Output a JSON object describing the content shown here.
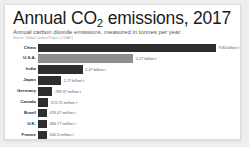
{
  "chart_data": {
    "type": "bar",
    "orientation": "horizontal",
    "title": "Annual CO2 emissions, 2017",
    "title_prefix": "Annual CO",
    "title_subscript": "2",
    "title_suffix": " emissions, 2017",
    "subtitle": "Annual carbon dioxide emissions, measured in tonnes per year",
    "source": "Source: Global Carbon Project (CDIAC)",
    "xlabel": "",
    "ylabel": "",
    "grid": false,
    "legend": "none",
    "unit": "tonnes per year",
    "xlim": [
      0,
      9840000000
    ],
    "categories": [
      "China",
      "U.S.A.",
      "India",
      "Japan",
      "Germany",
      "Canada",
      "Brazil",
      "U.K.",
      "France"
    ],
    "values": [
      9840000000,
      5270000000,
      2470000000,
      1270000000,
      799370000,
      572750000,
      476070000,
      384770000,
      340300000
    ],
    "value_labels": [
      "9.84 billion t",
      "5.27 billion t",
      "2.47 billion t",
      "1.27 billion t",
      "799.37 million t",
      "572.75 million t",
      "476.07 million t",
      "384.77 million t",
      "340.3 million t"
    ],
    "bar_colors": [
      "#2e2e2e",
      "#8d8d8d",
      "#2e2e2e",
      "#2e2e2e",
      "#2e2e2e",
      "#2e2e2e",
      "#2e2e2e",
      "#2e2e2e",
      "#2e2e2e"
    ],
    "highlight_color": "#8d8d8d",
    "default_color": "#2e2e2e"
  }
}
